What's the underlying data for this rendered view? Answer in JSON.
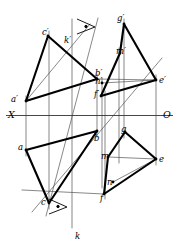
{
  "figure": {
    "type": "descriptive-geometry-projection",
    "width": 179,
    "height": 251,
    "background_color": "#ffffff",
    "ink_color": "#000000",
    "thin_line_color": "#555555",
    "ground_line": {
      "name": "X-O axis",
      "y": 115.5,
      "x_start": 6,
      "x_end": 173,
      "left_label": "X",
      "right_label": "O"
    },
    "labels": [
      {
        "id": "c-prime",
        "text": "c′",
        "x": 42,
        "y": 28,
        "size": "normal"
      },
      {
        "id": "k-prime",
        "text": "k′",
        "x": 64,
        "y": 36,
        "size": "normal"
      },
      {
        "id": "g-prime",
        "text": "g′",
        "x": 117,
        "y": 14,
        "size": "normal"
      },
      {
        "id": "m-prime",
        "text": "m′",
        "x": 116,
        "y": 47,
        "size": "normal"
      },
      {
        "id": "b-prime",
        "text": "b′",
        "x": 95,
        "y": 69,
        "size": "normal"
      },
      {
        "id": "n-prime",
        "text": "n′",
        "x": 95,
        "y": 77,
        "size": "normal"
      },
      {
        "id": "e-prime",
        "text": "e′",
        "x": 159,
        "y": 76,
        "size": "normal"
      },
      {
        "id": "f-prime",
        "text": "f′",
        "x": 94,
        "y": 90,
        "size": "normal"
      },
      {
        "id": "a-prime",
        "text": "a′",
        "x": 11,
        "y": 95,
        "size": "normal"
      },
      {
        "id": "x-axis",
        "text": "X",
        "x": 8,
        "y": 110,
        "size": "big"
      },
      {
        "id": "o-axis",
        "text": "O",
        "x": 163,
        "y": 110,
        "size": "big"
      },
      {
        "id": "b-point",
        "text": "b",
        "x": 94,
        "y": 134,
        "size": "normal"
      },
      {
        "id": "g-point",
        "text": "g",
        "x": 121,
        "y": 125,
        "size": "normal"
      },
      {
        "id": "a-point",
        "text": "a",
        "x": 18,
        "y": 143,
        "size": "normal"
      },
      {
        "id": "m-point",
        "text": "m",
        "x": 101,
        "y": 152,
        "size": "normal"
      },
      {
        "id": "e-point",
        "text": "e",
        "x": 159,
        "y": 155,
        "size": "normal"
      },
      {
        "id": "n-point",
        "text": "n",
        "x": 107,
        "y": 178,
        "size": "normal"
      },
      {
        "id": "c-point",
        "text": "c",
        "x": 41,
        "y": 198,
        "size": "normal"
      },
      {
        "id": "f-point",
        "text": "f",
        "x": 100,
        "y": 194,
        "size": "normal"
      },
      {
        "id": "k-point",
        "text": "k",
        "x": 75,
        "y": 232,
        "size": "normal"
      }
    ],
    "points": {
      "a_prime": [
        26,
        101
      ],
      "b_prime": [
        97,
        79
      ],
      "c_prime": [
        48,
        36
      ],
      "a": [
        26,
        150
      ],
      "b": [
        97,
        131
      ],
      "c": [
        49,
        203
      ],
      "e_prime": [
        156,
        80
      ],
      "f_prime": [
        101,
        96
      ],
      "g_prime": [
        124,
        24
      ],
      "m_prime": [
        120,
        53
      ],
      "n_prime": [
        102,
        83
      ],
      "e": [
        156,
        159
      ],
      "f": [
        104,
        194
      ],
      "g": [
        125,
        132
      ],
      "m": [
        108,
        157
      ],
      "n": [
        113,
        182
      ]
    },
    "thick_polylines": [
      {
        "id": "upper-left-triangle",
        "points": "26,101 48,36 97,79 26,101"
      },
      {
        "id": "lower-left-triangle",
        "points": "26,150 97,131 49,203 26,150"
      },
      {
        "id": "upper-right-triangle",
        "points": "124,24 156,80 101,96 120,53 124,24"
      },
      {
        "id": "lower-right-triangle",
        "points": "125,132 156,159 104,194 108,157 125,132"
      }
    ],
    "thin_lines": [
      {
        "id": "ground-line",
        "x1": 6,
        "y1": 115.5,
        "x2": 173,
        "y2": 115.5
      },
      {
        "id": "proj-a",
        "x1": 26,
        "y1": 96,
        "x2": 26,
        "y2": 156
      },
      {
        "id": "proj-c",
        "x1": 49,
        "y1": 31,
        "x2": 49,
        "y2": 209
      },
      {
        "id": "proj-k",
        "x1": 72,
        "y1": 19,
        "x2": 72,
        "y2": 228
      },
      {
        "id": "proj-b",
        "x1": 97,
        "y1": 74,
        "x2": 97,
        "y2": 137
      },
      {
        "id": "proj-n",
        "x1": 102,
        "y1": 78,
        "x2": 102,
        "y2": 188
      },
      {
        "id": "proj-f",
        "x1": 105,
        "y1": 91,
        "x2": 105,
        "y2": 199
      },
      {
        "id": "proj-m",
        "x1": 119,
        "y1": 48,
        "x2": 119,
        "y2": 163
      },
      {
        "id": "proj-g",
        "x1": 124,
        "y1": 19,
        "x2": 124,
        "y2": 138
      },
      {
        "id": "proj-e",
        "x1": 156,
        "y1": 75,
        "x2": 156,
        "y2": 165
      },
      {
        "id": "conn-bprime-eprime",
        "x1": 97,
        "y1": 79,
        "x2": 156,
        "y2": 80
      },
      {
        "id": "conn-nprime-mprime",
        "x1": 102,
        "y1": 83,
        "x2": 156,
        "y2": 80
      },
      {
        "id": "conn-m-e",
        "x1": 108,
        "y1": 157,
        "x2": 156,
        "y2": 159
      },
      {
        "id": "conn-n-e",
        "x1": 113,
        "y1": 182,
        "x2": 156,
        "y2": 159
      },
      {
        "id": "line-a-c-ext",
        "x1": 26,
        "y1": 101,
        "x2": 90,
        "y2": 24
      },
      {
        "id": "line-k-oblique",
        "x1": 46,
        "y1": 216,
        "x2": 98,
        "y2": 18
      },
      {
        "id": "line-k-thin-long",
        "x1": 32,
        "y1": 212,
        "x2": 162,
        "y2": 58
      },
      {
        "id": "line-f-diag",
        "x1": 22,
        "y1": 190,
        "x2": 104,
        "y2": 194
      }
    ],
    "right_angle_markers": [
      {
        "id": "marker-upper",
        "cx": 86,
        "cy": 26
      },
      {
        "id": "marker-lower",
        "cx": 58,
        "cy": 206
      }
    ]
  }
}
